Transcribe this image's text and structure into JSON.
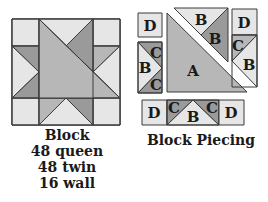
{
  "colors": {
    "light": "#e6e6e6",
    "medium": "#b7b7b7",
    "dark": "#9a9a9a",
    "outline": "#3a3a3a",
    "text": "#1a1a1a"
  },
  "block": {
    "caption_title": "Block",
    "caption_lines": [
      "48 queen",
      "48 twin",
      "16 wall"
    ]
  },
  "piecing": {
    "caption": "Block Piecing",
    "labels": {
      "top_left": "D",
      "top_center_b1": "B",
      "top_center_b2": "B",
      "top_right_d": "D",
      "top_right_c": "C",
      "top_right_b": "B",
      "left_c_top": "C",
      "left_b": "B",
      "left_c_bottom": "C",
      "center": "A",
      "bottom_d_left": "D",
      "bottom_c_left": "C",
      "bottom_b": "B",
      "bottom_c_right": "C",
      "bottom_d_right": "D"
    }
  }
}
